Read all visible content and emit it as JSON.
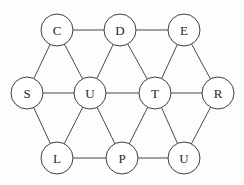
{
  "diagram": {
    "type": "node-link-graph",
    "width": 244,
    "height": 185,
    "background_color": "#fdfdfd",
    "node_fill_color": "#ffffff",
    "node_stroke_color": "#3e3e46",
    "edge_color": "#4a4a52",
    "label_color": "#26262b",
    "node_radius": 16,
    "nodes": [
      {
        "id": "C",
        "label": "C",
        "x": 57,
        "y": 30
      },
      {
        "id": "D",
        "label": "D",
        "x": 120,
        "y": 30
      },
      {
        "id": "E",
        "label": "E",
        "x": 184,
        "y": 30
      },
      {
        "id": "S",
        "label": "S",
        "x": 27,
        "y": 93
      },
      {
        "id": "U1",
        "label": "U",
        "x": 90,
        "y": 93
      },
      {
        "id": "T",
        "label": "T",
        "x": 155,
        "y": 93
      },
      {
        "id": "R",
        "label": "R",
        "x": 218,
        "y": 93
      },
      {
        "id": "L",
        "label": "L",
        "x": 57,
        "y": 158
      },
      {
        "id": "P",
        "label": "P",
        "x": 122,
        "y": 158
      },
      {
        "id": "U2",
        "label": "U",
        "x": 184,
        "y": 158
      }
    ],
    "edges": [
      {
        "from": "C",
        "to": "D"
      },
      {
        "from": "D",
        "to": "E"
      },
      {
        "from": "C",
        "to": "S"
      },
      {
        "from": "C",
        "to": "U1"
      },
      {
        "from": "D",
        "to": "U1"
      },
      {
        "from": "D",
        "to": "T"
      },
      {
        "from": "E",
        "to": "T"
      },
      {
        "from": "E",
        "to": "R"
      },
      {
        "from": "S",
        "to": "U1"
      },
      {
        "from": "U1",
        "to": "T"
      },
      {
        "from": "T",
        "to": "R"
      },
      {
        "from": "S",
        "to": "L"
      },
      {
        "from": "U1",
        "to": "L"
      },
      {
        "from": "U1",
        "to": "P"
      },
      {
        "from": "T",
        "to": "P"
      },
      {
        "from": "T",
        "to": "U2"
      },
      {
        "from": "R",
        "to": "U2"
      },
      {
        "from": "L",
        "to": "P"
      },
      {
        "from": "P",
        "to": "U2"
      }
    ]
  }
}
